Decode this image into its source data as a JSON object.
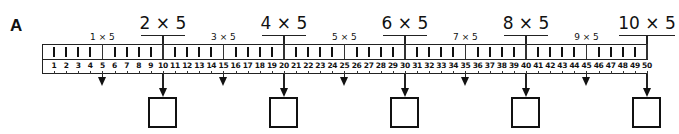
{
  "section": {
    "letter": "A"
  },
  "ruler": {
    "start": 1,
    "end": 50,
    "numbers": [
      "1",
      "2",
      "3",
      "4",
      "5",
      "6",
      "7",
      "8",
      "9",
      "10",
      "11",
      "12",
      "13",
      "14",
      "15",
      "16",
      "17",
      "18",
      "19",
      "20",
      "21",
      "22",
      "23",
      "24",
      "25",
      "26",
      "27",
      "28",
      "29",
      "30",
      "31",
      "32",
      "33",
      "34",
      "35",
      "36",
      "37",
      "38",
      "39",
      "40",
      "41",
      "42",
      "43",
      "44",
      "45",
      "46",
      "47",
      "48",
      "49",
      "50"
    ]
  },
  "small_labels": [
    {
      "text": "1 × 5",
      "at": 5
    },
    {
      "text": "3 × 5",
      "at": 15
    },
    {
      "text": "5 × 5",
      "at": 25
    },
    {
      "text": "7 × 5",
      "at": 35
    },
    {
      "text": "9 × 5",
      "at": 45
    }
  ],
  "big_labels": [
    {
      "text": "2 × 5",
      "at": 10,
      "answer": ""
    },
    {
      "text": "4 × 5",
      "at": 20,
      "answer": ""
    },
    {
      "text": "6 × 5",
      "at": 30,
      "answer": ""
    },
    {
      "text": "8 × 5",
      "at": 40,
      "answer": ""
    },
    {
      "text": "10 × 5",
      "at": 50,
      "answer": ""
    }
  ],
  "colors": {
    "ink": "#111111",
    "paper": "#ffffff"
  }
}
